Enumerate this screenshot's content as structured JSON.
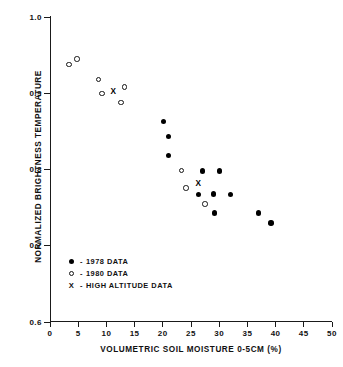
{
  "chart_data": {
    "type": "scatter",
    "title": "",
    "xlabel": "VOLUMETRIC SOIL MOISTURE 0-5CM (%)",
    "ylabel": "NORMALIZED BRIGHTNESS TEMPERATURE",
    "xlim": [
      0,
      50
    ],
    "ylim": [
      0.6,
      1.0
    ],
    "xticks": [
      "0",
      "5",
      "10",
      "15",
      "20",
      "25",
      "30",
      "35",
      "40",
      "45",
      "50"
    ],
    "xtick_values": [
      0,
      5,
      10,
      15,
      20,
      25,
      30,
      35,
      40,
      45,
      50
    ],
    "yticks": [
      "1.0",
      "0.9",
      "0.8",
      "0.7",
      "0.6"
    ],
    "ytick_values": [
      1.0,
      0.9,
      0.8,
      0.7,
      0.6
    ],
    "grid": false,
    "legend_position": "lower-left-inside",
    "series": [
      {
        "name": "1978 DATA",
        "marker": "filled-circle",
        "color": "#000000",
        "points": [
          [
            20.1,
            0.863
          ],
          [
            21.0,
            0.843
          ],
          [
            21.0,
            0.818
          ],
          [
            27.0,
            0.798
          ],
          [
            30.0,
            0.798
          ],
          [
            26.3,
            0.767
          ],
          [
            29.0,
            0.768
          ],
          [
            32.0,
            0.767
          ],
          [
            29.2,
            0.743
          ],
          [
            37.0,
            0.743
          ],
          [
            39.2,
            0.73
          ]
        ]
      },
      {
        "name": "1980 DATA",
        "marker": "open-circle",
        "color": "#141414",
        "points": [
          [
            3.4,
            0.938
          ],
          [
            4.8,
            0.945
          ],
          [
            8.6,
            0.918
          ],
          [
            9.2,
            0.9
          ],
          [
            12.6,
            0.888
          ],
          [
            13.2,
            0.908
          ],
          [
            23.3,
            0.799
          ],
          [
            24.1,
            0.776
          ],
          [
            27.5,
            0.755
          ]
        ]
      },
      {
        "name": "HIGH ALTITUDE DATA",
        "marker": "x",
        "color": "#000000",
        "points": [
          [
            11.2,
            0.9
          ],
          [
            26.3,
            0.78
          ]
        ]
      }
    ],
    "legend": [
      {
        "symbol": "filled-circle",
        "dash": "-",
        "label": "1978 DATA"
      },
      {
        "symbol": "open-circle",
        "dash": "-",
        "label": "1980 DATA"
      },
      {
        "symbol": "x",
        "dash": "-",
        "label": "HIGH ALTITUDE DATA"
      }
    ]
  }
}
